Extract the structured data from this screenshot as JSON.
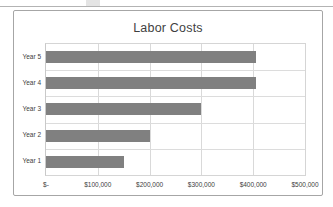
{
  "page": {
    "top_rule": "",
    "background_color": "#ffffff"
  },
  "chart_frame": {
    "border_color": "#a6a6a6"
  },
  "chart_data": {
    "type": "bar",
    "orientation": "horizontal",
    "title": "Labor Costs",
    "xlabel": "",
    "ylabel": "",
    "categories": [
      "Year 1",
      "Year 2",
      "Year 3",
      "Year 4",
      "Year 5"
    ],
    "values": [
      150000,
      200000,
      300000,
      405000,
      405000
    ],
    "display_order_top_to_bottom": [
      "Year 5",
      "Year 4",
      "Year 3",
      "Year 2",
      "Year 1"
    ],
    "xlim": [
      0,
      500000
    ],
    "xticks": [
      0,
      100000,
      200000,
      300000,
      400000,
      500000
    ],
    "xtick_labels": [
      "$-",
      "$100,000",
      "$200,000",
      "$300,000",
      "$400,000",
      "$500,000"
    ],
    "grid": "vertical-and-horizontal",
    "legend": "none",
    "bar_color": "#808080",
    "gridline_color": "#d9d9d9",
    "plot_background": "#ffffff"
  }
}
